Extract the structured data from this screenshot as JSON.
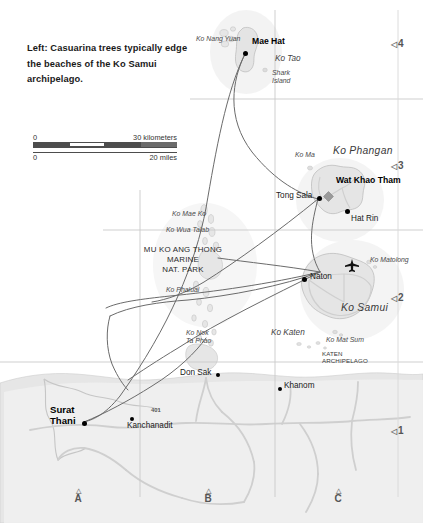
{
  "caption": {
    "text": "Left: Casuarina trees typically edge the beaches of the Ko Samui archipelago."
  },
  "scale_bar": {
    "km_zero": "0",
    "km_max": "30 kilometers",
    "mi_zero": "0",
    "mi_max": "20 miles"
  },
  "grid": {
    "columns": [
      "A",
      "B",
      "C"
    ],
    "rows": [
      "4",
      "3",
      "2",
      "1"
    ],
    "tri_left": "◁",
    "tri_up": "△"
  },
  "places": {
    "mae_hat": "Mae Hat",
    "tong_sala": "Tong Sala",
    "hat_rin": "Hat Rin",
    "naton": "Naton",
    "wat_khao_tham": "Wat Khao Tham",
    "surat_thani_line1": "Surat",
    "surat_thani_line2": "Thani",
    "kanchanadit": "Kanchanadit",
    "don_sak": "Don Sak",
    "khanom": "Khanom"
  },
  "islands": {
    "ko_nang_yuan": "Ko Nang Yuan",
    "ko_tao": "Ko Tao",
    "shark_island_l1": "Shark",
    "shark_island_l2": "Island",
    "ko_ma": "Ko Ma",
    "ko_phangan": "Ko Phangan",
    "ko_samui": "Ko Samui",
    "ko_matolong": "Ko Matolong",
    "ko_mat_sum": "Ko Mat Sum",
    "ko_mae_ko": "Ko Mae Ko",
    "ko_wua_talab": "Ko Wua Talab",
    "ko_phaluai": "Ko Phaluai",
    "ko_nok_l1": "Ko Nok",
    "ko_nok_l2": "Ta Phao",
    "ko_katen": "Ko Katen"
  },
  "areas": {
    "park_l1": "MU KO ANG THONG",
    "park_l2": "MARINE",
    "park_l3": "NAT. PARK",
    "archipelago_l1": "KATEN",
    "archipelago_l2": "ARCHIPELAGO"
  },
  "roads": {
    "route_401": "401"
  },
  "icons": {
    "airport": "airplane-icon"
  },
  "colors": {
    "land": "#e8e8e8",
    "land_edge": "#bdbdbd",
    "sea": "#ffffff",
    "grid_line": "#c9c9c9",
    "ferry_route": "#6b6b6b",
    "road": "#cfcfcf",
    "river": "#c2c2c2",
    "text": "#231f20",
    "marker": "#000000",
    "poi_marker": "#8c8c8c"
  }
}
